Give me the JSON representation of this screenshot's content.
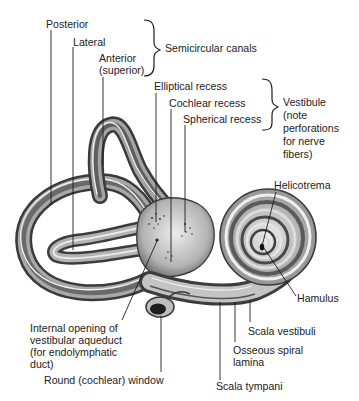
{
  "figure": {
    "colors": {
      "background": "#ffffff",
      "bone_light": "#e2e2e2",
      "bone_mid": "#9a9a9a",
      "bone_dark": "#3c3c3c",
      "leader": "#1e1e1e"
    }
  },
  "groups": {
    "semicircular_canals": "Semicircular canals",
    "vestibule": [
      "Vestibule",
      "(note",
      "perforations",
      "for nerve",
      "fibers)"
    ]
  },
  "labels": {
    "posterior": "Posterior",
    "lateral": "Lateral",
    "anterior": [
      "Anterior",
      "(superior)"
    ],
    "elliptical_recess": "Elliptical recess",
    "cochlear_recess": "Cochlear recess",
    "spherical_recess": "Spherical recess",
    "helicotrema": "Helicotrema",
    "hamulus": "Hamulus",
    "scala_vestibuli": "Scala vestibuli",
    "osseous_spiral_lamina": [
      "Osseous spiral",
      "lamina"
    ],
    "scala_tympani": "Scala tympani",
    "internal_opening": [
      "Internal opening of",
      "vestibular aqueduct",
      "(for endolymphatic",
      "duct)"
    ],
    "round_window": "Round (cochlear) window"
  }
}
